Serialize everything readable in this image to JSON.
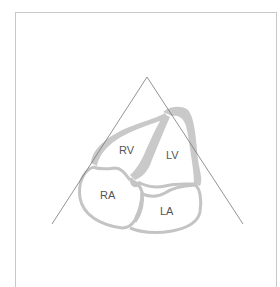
{
  "diagram": {
    "type": "apical four-chamber echocardiography view",
    "labels": {
      "rv": "RV",
      "lv": "LV",
      "ra": "RA",
      "la": "LA"
    },
    "colors": {
      "wall": "#c9c9c9",
      "wall_outline": "#c4c4c4",
      "sector_line": "#777777",
      "frame": "#c8c8c8",
      "label": "#555555",
      "background": "#ffffff"
    }
  }
}
